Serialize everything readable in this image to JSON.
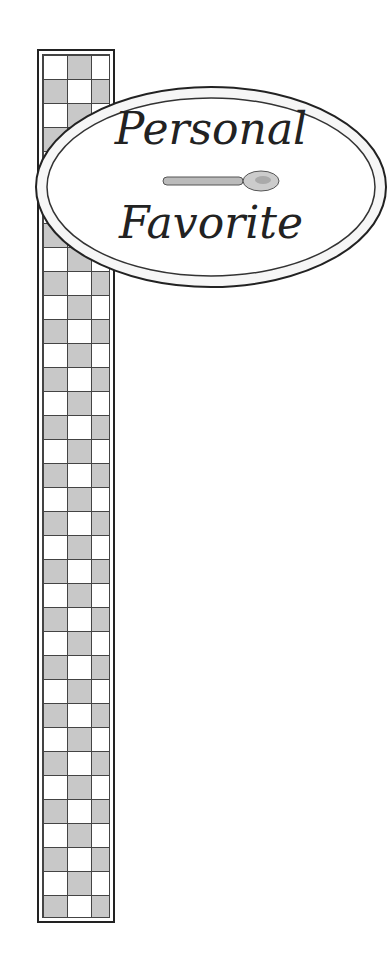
{
  "sign": {
    "line1": "Personal",
    "line2": "Favorite",
    "icon": "spoon-icon"
  },
  "colors": {
    "outline": "#222222",
    "checker_gray": "#c8c8c8",
    "background": "#ffffff"
  }
}
